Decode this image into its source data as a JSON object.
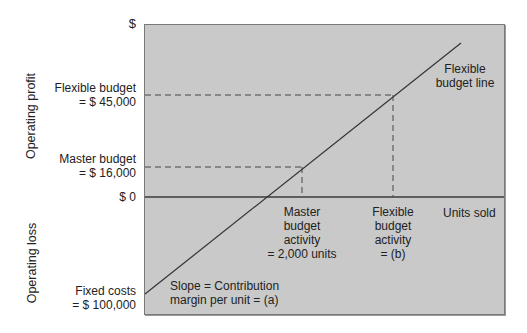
{
  "y_axis": {
    "top_tick": "$",
    "zero_tick": "$ 0",
    "profit_label": "Operating profit",
    "loss_label": "Operating loss"
  },
  "y_labels": {
    "flexible_budget_line1": "Flexible budget",
    "flexible_budget_line2": "= $ 45,000",
    "master_budget_line1": "Master budget",
    "master_budget_line2": "= $ 16,000",
    "fixed_costs_line1": "Fixed costs",
    "fixed_costs_line2": "= $ 100,000"
  },
  "x_labels": {
    "master_activity": [
      "Master",
      "budget",
      "activity",
      "= 2,000 units"
    ],
    "flexible_activity": [
      "Flexible",
      "budget",
      "activity",
      "= (b)"
    ],
    "units_sold": "Units sold"
  },
  "annotations": {
    "flexible_budget_line": [
      "Flexible",
      "budget line"
    ],
    "slope": [
      "Slope = Contribution",
      "margin per unit = (a)"
    ]
  },
  "colors": {
    "plot_background": "#c9c9c9",
    "line": "#333333",
    "dashed": "#444444"
  }
}
